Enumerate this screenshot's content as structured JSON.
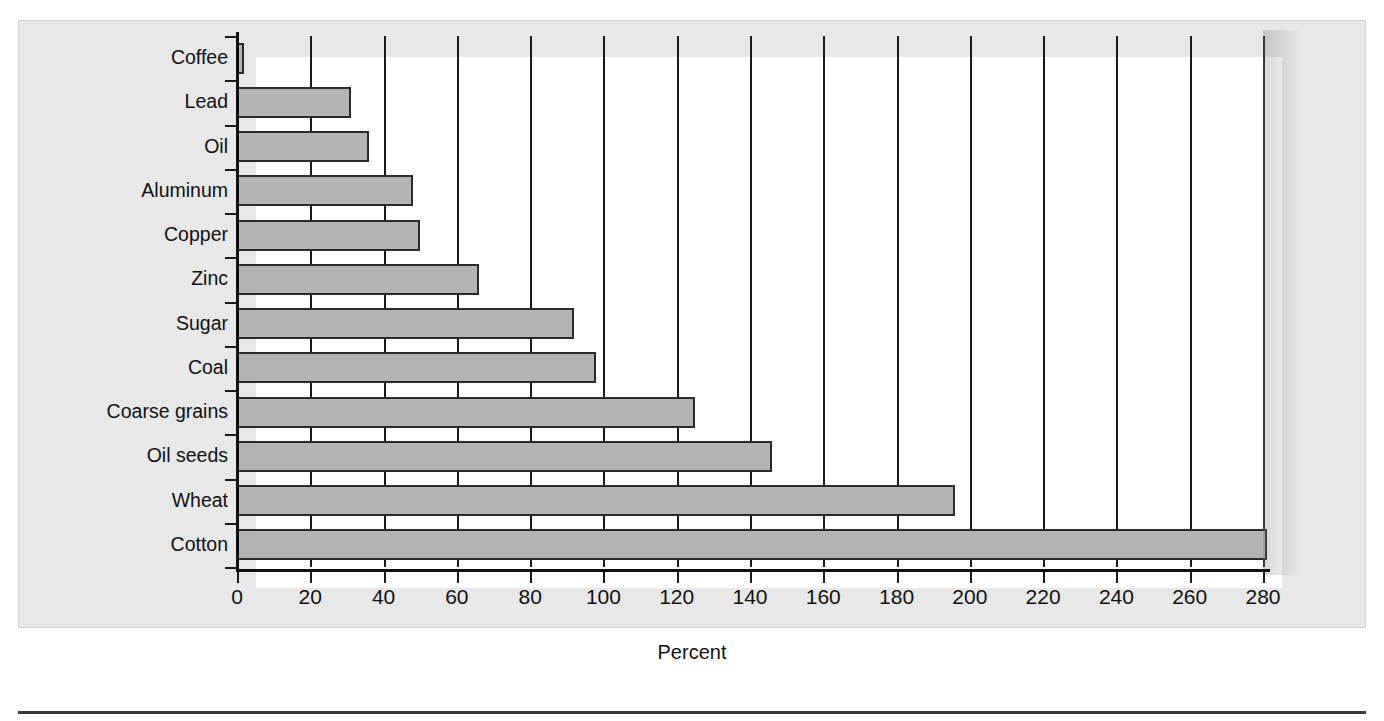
{
  "figure": {
    "panel_bg": "#e8e8e8",
    "plot_bg": "#ffffff",
    "bar_fill": "#b4b4b4",
    "bar_stroke": "#2b2b2b",
    "axis_color": "#1a1a1a",
    "top_sliver_text": ""
  },
  "chart_data": {
    "type": "bar",
    "orientation": "horizontal",
    "title": "",
    "subtitle": "",
    "xlabel": "Percent",
    "ylabel": "",
    "xlim": [
      0,
      280
    ],
    "ylim": null,
    "grid": "vertical",
    "legend": null,
    "legend_position": "none",
    "xticks": [
      0,
      20,
      40,
      60,
      80,
      100,
      120,
      140,
      160,
      180,
      200,
      220,
      240,
      260,
      280
    ],
    "xtick_labels": [
      "0",
      "20",
      "40",
      "60",
      "80",
      "100",
      "120",
      "140",
      "160",
      "180",
      "200",
      "220",
      "240",
      "260",
      "280"
    ],
    "categories": [
      "Coffee",
      "Lead",
      "Oil",
      "Aluminum",
      "Copper",
      "Zinc",
      "Sugar",
      "Coal",
      "Coarse grains",
      "Oil seeds",
      "Wheat",
      "Cotton"
    ],
    "values": [
      2,
      31,
      36,
      48,
      50,
      66,
      92,
      98,
      125,
      146,
      196,
      281
    ],
    "annotations": []
  },
  "axis": {
    "x_title": "Percent"
  }
}
